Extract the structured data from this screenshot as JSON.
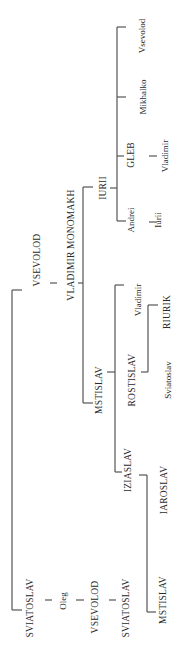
{
  "diagram": {
    "type": "genealogy-tree",
    "orientation": "rotated-90-ccw",
    "nodes": [
      {
        "id": "sviatoslav1",
        "label": "SVIATOSLAV",
        "x": 31,
        "y": 608,
        "style": "caps"
      },
      {
        "id": "oleg",
        "label": "Oleg",
        "x": 63,
        "y": 601,
        "style": "small"
      },
      {
        "id": "vsevolod2",
        "label": "VSEVOLOD",
        "x": 96,
        "y": 607,
        "style": "caps"
      },
      {
        "id": "sviatoslav3",
        "label": "SVIATOSLAV",
        "x": 127,
        "y": 608,
        "style": "caps"
      },
      {
        "id": "vsevolod1",
        "label": "VSEVOLOD",
        "x": 38,
        "y": 260,
        "style": "caps"
      },
      {
        "id": "monomakh",
        "label": "VLADIMIR MONOMAKH",
        "x": 72,
        "y": 245,
        "style": "caps"
      },
      {
        "id": "iurii",
        "label": "IURII",
        "x": 104,
        "y": 188,
        "style": "caps"
      },
      {
        "id": "mstislav1",
        "label": "MSTISLAV",
        "x": 100,
        "y": 390,
        "style": "caps"
      },
      {
        "id": "andrei",
        "label": "Andrei",
        "x": 131,
        "y": 220,
        "style": "small"
      },
      {
        "id": "iurii2",
        "label": "Iurii",
        "x": 158,
        "y": 220,
        "style": "small"
      },
      {
        "id": "gleb",
        "label": "GLEB",
        "x": 132,
        "y": 155,
        "style": "caps"
      },
      {
        "id": "vladimir3",
        "label": "Vladimir",
        "x": 165,
        "y": 156,
        "style": "small"
      },
      {
        "id": "mikhalko",
        "label": "Mikhalko",
        "x": 143,
        "y": 97,
        "style": "small"
      },
      {
        "id": "vsevolod3",
        "label": "Vsevolod",
        "x": 142,
        "y": 36,
        "style": "small"
      },
      {
        "id": "vladimir2",
        "label": "Vladimir",
        "x": 138,
        "y": 300,
        "style": "small"
      },
      {
        "id": "rostislav",
        "label": "ROSTISLAV",
        "x": 133,
        "y": 380,
        "style": "caps"
      },
      {
        "id": "iziaslav",
        "label": "IZIASLAV",
        "x": 129,
        "y": 470,
        "style": "caps"
      },
      {
        "id": "riurik",
        "label": "RIURIK",
        "x": 168,
        "y": 312,
        "style": "caps"
      },
      {
        "id": "sviatoslav4",
        "label": "Sviatoslav",
        "x": 168,
        "y": 380,
        "style": "small"
      },
      {
        "id": "iaroslav",
        "label": "IAROSLAV",
        "x": 165,
        "y": 490,
        "style": "caps"
      },
      {
        "id": "mstislav2",
        "label": "MSTISLAV",
        "x": 164,
        "y": 600,
        "style": "caps"
      }
    ]
  }
}
